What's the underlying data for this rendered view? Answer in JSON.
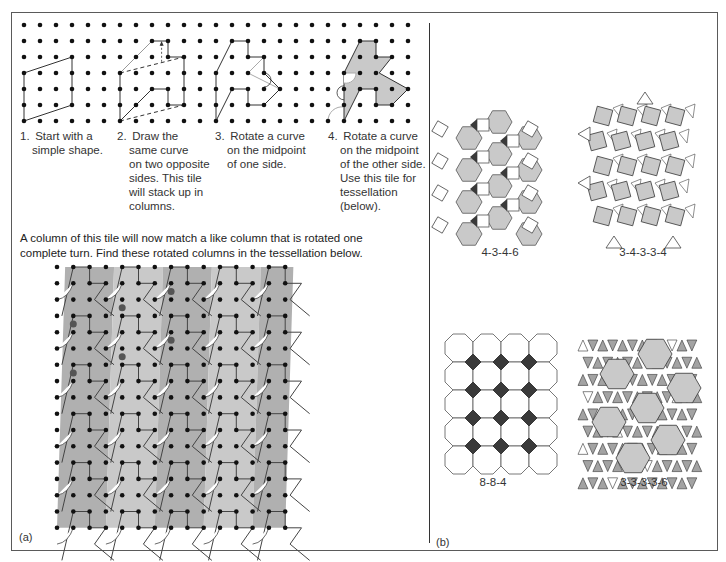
{
  "figure": {
    "panel_a": {
      "label": "(a)",
      "steps": [
        {
          "number": "1.",
          "text": "Start with a simple shape."
        },
        {
          "number": "2.",
          "text": "Draw the same curve on two opposite sides. This tile will stack up in columns."
        },
        {
          "number": "3.",
          "text": "Rotate a curve on the midpoint of one side."
        },
        {
          "number": "4.",
          "text": "Rotate a curve on the midpoint of the other side. Use this tile for tessellation (below)."
        }
      ],
      "steps_lines": [
        [
          "Start with a",
          "simple shape."
        ],
        [
          "Draw the",
          "same curve",
          "on two opposite",
          "sides. This tile",
          "will stack up in",
          "columns."
        ],
        [
          "Rotate a curve",
          "on the midpoint",
          "of one side."
        ],
        [
          "Rotate a curve",
          "on the midpoint",
          "of the other side.",
          "Use this tile for",
          "tessellation",
          "(below)."
        ]
      ],
      "description_line1": "A column of this tile will now match a like column that is rotated one",
      "description_line2": "complete turn. Find these rotated columns in the tessellation below."
    },
    "panel_b": {
      "label": "(b)",
      "tessellations": [
        {
          "name": "4-3-4-6"
        },
        {
          "name": "3-4-3-3-4"
        },
        {
          "name": "8-8-4"
        },
        {
          "name": "3-3-3-3-6"
        }
      ]
    },
    "colors": {
      "tile_light": "#c9c9c9",
      "tile_mid": "#b0b0b0",
      "tile_dark": "#a3a3a3",
      "accent_dark": "#3a3a3a",
      "dot": "#111111",
      "marker": "#555555"
    }
  }
}
